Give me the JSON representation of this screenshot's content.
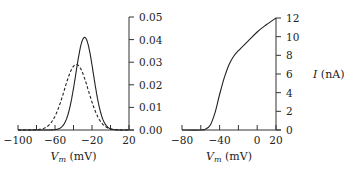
{
  "chart_data": [
    {
      "type": "line",
      "title": "",
      "xlabel": "V_m (mV)",
      "ylabel": "",
      "xlim": [
        -100,
        20
      ],
      "ylim": [
        0,
        0.05
      ],
      "x_ticks": [
        "−100",
        "",
        "−60",
        "",
        "−20",
        "",
        "20"
      ],
      "y_ticks": [
        "0.00",
        "0.01",
        "0.02",
        "0.03",
        "0.04",
        "0.05"
      ],
      "y_axis_position": "right",
      "grid": false,
      "series": [
        {
          "name": "solid",
          "style": "solid",
          "shape": "gaussian",
          "peak_x": -28,
          "peak_y": 0.041,
          "sigma": 9.5
        },
        {
          "name": "dashed",
          "style": "dashed",
          "shape": "gaussian",
          "peak_x": -37,
          "peak_y": 0.029,
          "sigma": 13
        }
      ]
    },
    {
      "type": "line",
      "title": "",
      "xlabel": "V_m (mV)",
      "ylabel": "I (nA)",
      "xlim": [
        -80,
        20
      ],
      "ylim": [
        0,
        12
      ],
      "x_ticks": [
        "−80",
        "",
        "−40",
        "",
        "0",
        "20"
      ],
      "y_ticks": [
        "0",
        "2",
        "4",
        "6",
        "8",
        "10",
        "12"
      ],
      "y_axis_position": "right",
      "grid": false,
      "series": [
        {
          "name": "I-V",
          "style": "solid",
          "x": [
            -80,
            -60,
            -55,
            -50,
            -45,
            -40,
            -35,
            -30,
            -25,
            -20,
            -10,
            0,
            10,
            20
          ],
          "y": [
            0,
            0,
            0.1,
            0.5,
            1.8,
            3.8,
            5.6,
            7.0,
            7.9,
            8.5,
            9.5,
            10.5,
            11.3,
            12
          ]
        }
      ]
    }
  ]
}
